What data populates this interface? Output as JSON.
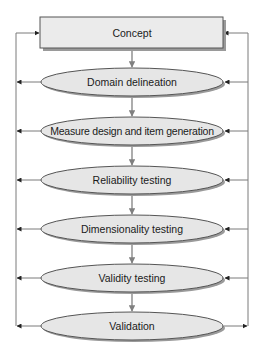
{
  "diagram": {
    "colors": {
      "box_fill": "#ebebeb",
      "ellipse_fill": "#e6e6e6",
      "stroke": "#555555",
      "shadow": "#9a9a9a",
      "arrow": "#808080",
      "side_line": "#7a7a7a"
    },
    "nodes": [
      {
        "id": "concept",
        "shape": "rectangle",
        "label": "Concept"
      },
      {
        "id": "domain",
        "shape": "ellipse",
        "label": "Domain delineation"
      },
      {
        "id": "measure",
        "shape": "ellipse",
        "label": "Measure design and item generation"
      },
      {
        "id": "reliability",
        "shape": "ellipse",
        "label": "Reliability testing"
      },
      {
        "id": "dimensionality",
        "shape": "ellipse",
        "label": "Dimensionality testing"
      },
      {
        "id": "validity",
        "shape": "ellipse",
        "label": "Validity testing"
      },
      {
        "id": "validation",
        "shape": "ellipse",
        "label": "Validation"
      }
    ],
    "edges": [
      {
        "from": "concept",
        "to": "domain"
      },
      {
        "from": "domain",
        "to": "measure"
      },
      {
        "from": "measure",
        "to": "reliability"
      },
      {
        "from": "reliability",
        "to": "dimensionality"
      },
      {
        "from": "dimensionality",
        "to": "validity"
      },
      {
        "from": "validity",
        "to": "validation"
      }
    ],
    "feedback": {
      "left": "Each stage feeds back to Concept via left loop",
      "right": "Validation feeds right loop back into each stage and Concept"
    }
  }
}
